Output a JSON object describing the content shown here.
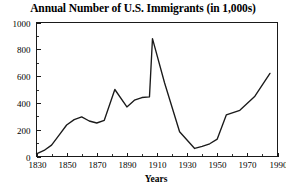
{
  "chart_data": {
    "type": "line",
    "title": "Annual Number of U.S. Immigrants (in 1,000s)",
    "xlabel": "Years",
    "ylabel": "",
    "xlim": [
      1830,
      1990
    ],
    "ylim": [
      0,
      1000
    ],
    "grid": false,
    "legend": false,
    "x_major_ticks": [
      1830,
      1850,
      1870,
      1890,
      1910,
      1930,
      1950,
      1970,
      1990
    ],
    "x_major_tick_labels": [
      "1830",
      "1850",
      "1870",
      "1890",
      "1910",
      "1930",
      "1950",
      "1970",
      "1990"
    ],
    "x_minor_ticks": [
      1840,
      1860,
      1880,
      1900,
      1920,
      1940,
      1960,
      1980
    ],
    "y_major_ticks": [
      0,
      200,
      400,
      600,
      800,
      1000
    ],
    "y_major_tick_labels": [
      "0",
      "200",
      "400",
      "600",
      "800",
      "1000"
    ],
    "y_minor_ticks": [
      100,
      300,
      500,
      700,
      900
    ],
    "series": [
      {
        "name": "Annual U.S. immigrants",
        "x": [
          1830,
          1835,
          1840,
          1845,
          1850,
          1855,
          1860,
          1865,
          1870,
          1875,
          1882,
          1890,
          1895,
          1900,
          1905,
          1907,
          1915,
          1925,
          1935,
          1940,
          1945,
          1950,
          1956,
          1965,
          1975,
          1985
        ],
        "values": [
          20,
          45,
          85,
          160,
          235,
          275,
          295,
          265,
          250,
          270,
          500,
          370,
          420,
          440,
          445,
          880,
          550,
          185,
          60,
          75,
          95,
          130,
          310,
          345,
          450,
          620
        ]
      }
    ]
  },
  "axes": {
    "y_axis_label_name": "y-axis",
    "x_axis_label_name": "x-axis"
  }
}
